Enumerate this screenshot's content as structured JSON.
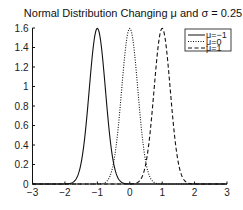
{
  "chart_data": {
    "type": "line",
    "title": "Normal Distribution Changing μ and σ = 0.25",
    "xlabel": "",
    "ylabel": "",
    "xlim": [
      -3,
      3
    ],
    "ylim": [
      0,
      1.6
    ],
    "xticks": [
      -3,
      -2,
      -1,
      0,
      1,
      2,
      3
    ],
    "xtick_labels": [
      "−3",
      "−2",
      "−1",
      "0",
      "1",
      "2",
      "3"
    ],
    "yticks": [
      0,
      0.2,
      0.4,
      0.6,
      0.8,
      1,
      1.2,
      1.4,
      1.6
    ],
    "ytick_labels": [
      "0",
      "0.2",
      "0.4",
      "0.6",
      "0.8",
      "1",
      "1.2",
      "1.4",
      "1.6"
    ],
    "grid": false,
    "legend_position": "upper right",
    "sigma": 0.25,
    "series": [
      {
        "name": "μ=−1",
        "mu": -1,
        "style": "solid",
        "peak": 1.596,
        "x": [
          -2,
          -1.75,
          -1.5,
          -1.25,
          -1,
          -0.75,
          -0.5,
          -0.25,
          0
        ],
        "values": [
          0.001,
          0.018,
          0.216,
          0.968,
          1.596,
          0.968,
          0.216,
          0.018,
          0.001
        ]
      },
      {
        "name": "μ=0",
        "mu": 0,
        "style": "dotted",
        "peak": 1.596,
        "x": [
          -1,
          -0.75,
          -0.5,
          -0.25,
          0,
          0.25,
          0.5,
          0.75,
          1
        ],
        "values": [
          0.001,
          0.018,
          0.216,
          0.968,
          1.596,
          0.968,
          0.216,
          0.018,
          0.001
        ]
      },
      {
        "name": "μ=1",
        "mu": 1,
        "style": "dashed",
        "peak": 1.596,
        "x": [
          0,
          0.25,
          0.5,
          0.75,
          1,
          1.25,
          1.5,
          1.75,
          2
        ],
        "values": [
          0.001,
          0.018,
          0.216,
          0.968,
          1.596,
          0.968,
          0.216,
          0.018,
          0.001
        ]
      }
    ]
  },
  "layout": {
    "plot_left": 32.5,
    "plot_right": 227,
    "plot_top": 28,
    "plot_bottom": 184,
    "line_color": "#111111"
  }
}
